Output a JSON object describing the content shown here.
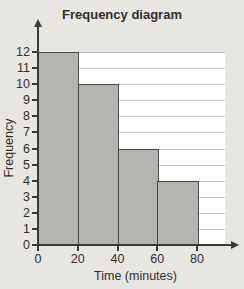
{
  "chart_data": {
    "type": "bar",
    "title": "Frequency diagram",
    "xlabel": "Time (minutes)",
    "ylabel": "Frequency",
    "categories": [
      "0-20",
      "20-40",
      "40-60",
      "60-80"
    ],
    "values": [
      12,
      10,
      6,
      4
    ],
    "bin_width": 20,
    "xlim": [
      0,
      80
    ],
    "ylim": [
      0,
      12
    ],
    "xticks": [
      0,
      20,
      40,
      60,
      80
    ],
    "yticks": [
      0,
      1,
      2,
      3,
      4,
      5,
      6,
      7,
      8,
      9,
      10,
      11,
      12
    ],
    "grid": "horizontal",
    "legend": "none",
    "colors": {
      "background": "#e8e6e0",
      "plot_background": "#ffffff",
      "gridline": "#c9c7c4",
      "axis": "#3a3a3a",
      "bar_fill": "#b5b3b0",
      "bar_border": "#4a4a48",
      "text": "#2f2f2f"
    }
  }
}
